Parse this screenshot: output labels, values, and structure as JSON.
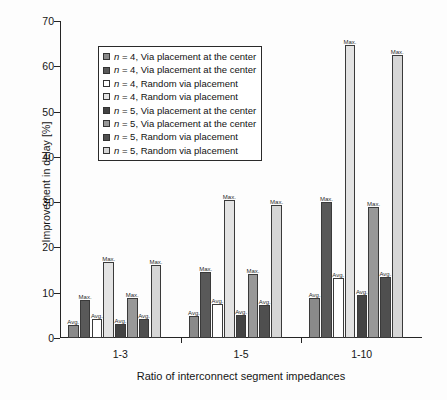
{
  "chart_data": {
    "type": "bar",
    "title": "",
    "xlabel": "Ratio of interconnect segment impedances",
    "ylabel": "Improvement in delay [%]",
    "ylim": [
      0,
      70
    ],
    "ytick_labels": [
      "0",
      "10",
      "20",
      "30",
      "40",
      "50",
      "60",
      "70"
    ],
    "ytick_values": [
      0,
      10,
      20,
      30,
      40,
      50,
      60,
      70
    ],
    "grid": false,
    "legend_position": "upper-left-inside",
    "categories": [
      "1-3",
      "1-5",
      "1-10"
    ],
    "series": [
      {
        "name": "n = 4, Via placement at the center",
        "stat": "Avg.",
        "color": "#8a8a8a",
        "values": [
          2.8,
          4.8,
          8.9
        ]
      },
      {
        "name": "n = 4, Via placement at the center",
        "stat": "Max.",
        "color": "#595959",
        "values": [
          8.4,
          14.6,
          30.0
        ]
      },
      {
        "name": "n = 4, Random via placement",
        "stat": "Avg.",
        "color": "#ffffff",
        "values": [
          4.2,
          7.5,
          13.2
        ]
      },
      {
        "name": "n = 4, Random via placement",
        "stat": "Max.",
        "color": "#e3e3e3",
        "values": [
          16.8,
          30.4,
          64.6
        ]
      },
      {
        "name": "n = 5, Via placement at the center",
        "stat": "Avg.",
        "color": "#434343",
        "values": [
          3.0,
          5.1,
          9.5
        ]
      },
      {
        "name": "n = 5, Via placement at the center",
        "stat": "Max.",
        "color": "#989898",
        "values": [
          8.9,
          14.2,
          29.0
        ]
      },
      {
        "name": "n = 5, Random via placement",
        "stat": "Avg.",
        "color": "#4f4f4f",
        "values": [
          4.2,
          7.4,
          13.4
        ]
      },
      {
        "name": "n = 5, Random via placement",
        "stat": "Max.",
        "color": "#d6d6d6",
        "values": [
          16.2,
          29.4,
          62.6
        ]
      }
    ],
    "annotations": {
      "avg_label": "Avg.",
      "max_label": "Max."
    }
  },
  "legend": {
    "entries": [
      {
        "prefix": "n",
        "rest": "= 4, Via placement at the center",
        "swatch": "#8a8a8a"
      },
      {
        "prefix": "n",
        "rest": "= 4, Via placement at the center",
        "swatch": "#595959"
      },
      {
        "prefix": "n",
        "rest": "= 4, Random via placement",
        "swatch": "#ffffff"
      },
      {
        "prefix": "n",
        "rest": "= 4, Random via placement",
        "swatch": "#e3e3e3"
      },
      {
        "prefix": "n",
        "rest": "= 5, Via placement at the center",
        "swatch": "#434343"
      },
      {
        "prefix": "n",
        "rest": "= 5, Via placement at the center",
        "swatch": "#989898"
      },
      {
        "prefix": "n",
        "rest": "= 5, Random via placement",
        "swatch": "#4f4f4f"
      },
      {
        "prefix": "n",
        "rest": "= 5, Random via placement",
        "swatch": "#d6d6d6"
      }
    ]
  }
}
